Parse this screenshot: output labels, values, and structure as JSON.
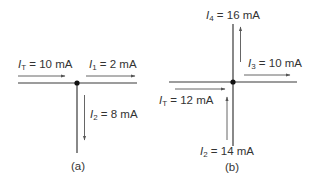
{
  "diagram_a": {
    "caption": "(a)",
    "currents": [
      {
        "symbol": "I",
        "subscript": "T",
        "value": "= 10 mA",
        "direction": "in (right)"
      },
      {
        "symbol": "I",
        "subscript": "1",
        "value": "= 2 mA",
        "direction": "out (right)"
      },
      {
        "symbol": "I",
        "subscript": "2",
        "value": "= 8 mA",
        "direction": "out (down)"
      }
    ]
  },
  "diagram_b": {
    "caption": "(b)",
    "currents": [
      {
        "symbol": "I",
        "subscript": "4",
        "value": "= 16 mA",
        "direction": "out (up)"
      },
      {
        "symbol": "I",
        "subscript": "3",
        "value": "= 10 mA",
        "direction": "out (right)"
      },
      {
        "symbol": "I",
        "subscript": "T",
        "value": "= 12 mA",
        "direction": "in (right)"
      },
      {
        "symbol": "I",
        "subscript": "2",
        "value": "= 14 mA",
        "direction": "in (up)"
      }
    ]
  },
  "colors": {
    "wire": "#3a3a3a",
    "arrow": "#555555",
    "text": "#333333"
  }
}
